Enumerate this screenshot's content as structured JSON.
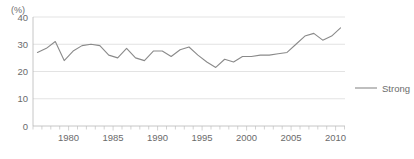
{
  "chart_data": {
    "type": "line",
    "title": "",
    "subtitle": "",
    "xlabel": "",
    "ylabel": "",
    "unit_label": "(%)",
    "grid": true,
    "legend_position": "right",
    "xlim": [
      1976.5,
      2011.5
    ],
    "ylim": [
      0,
      40
    ],
    "y_ticks": [
      0,
      10,
      20,
      30,
      40
    ],
    "y_tick_labels": [
      "0",
      "10",
      "20",
      "30",
      "40"
    ],
    "x_ticks_labeled": [
      1980,
      1985,
      1990,
      1995,
      2000,
      2005,
      2010
    ],
    "x_tick_labels": [
      "1980",
      "1985",
      "1990",
      "1995",
      "2000",
      "2005",
      "2010"
    ],
    "x": [
      1977,
      1978,
      1979,
      1980,
      1981,
      1982,
      1983,
      1984,
      1985,
      1986,
      1987,
      1988,
      1989,
      1990,
      1991,
      1992,
      1993,
      1994,
      1995,
      1996,
      1997,
      1998,
      1999,
      2000,
      2001,
      2002,
      2003,
      2004,
      2005,
      2006,
      2007,
      2008,
      2009,
      2010,
      2011
    ],
    "series": [
      {
        "name": "Strong",
        "color": "#8a8a8a",
        "values": [
          27.0,
          28.5,
          31.0,
          24.0,
          27.5,
          29.5,
          30.0,
          29.5,
          26.0,
          25.0,
          28.5,
          25.0,
          24.0,
          27.5,
          27.5,
          25.5,
          28.0,
          29.0,
          26.0,
          23.5,
          21.5,
          24.5,
          23.5,
          25.5,
          25.5,
          26.0,
          26.0,
          26.5,
          27.0,
          30.0,
          33.0,
          34.0,
          31.5,
          33.0,
          36.0
        ]
      }
    ],
    "legend": [
      {
        "label": "Strong",
        "color": "#8a8a8a"
      }
    ]
  }
}
